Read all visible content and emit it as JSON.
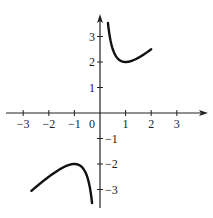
{
  "chart_data": {
    "type": "line",
    "title": "",
    "function": "y = x + 1/x",
    "xlabel": "",
    "ylabel": "",
    "xlim": [
      -3.5,
      4
    ],
    "ylim": [
      -3.7,
      3.8
    ],
    "grid": false,
    "legend": null,
    "x_ticks": [
      -3,
      -2,
      -1,
      1,
      2,
      3
    ],
    "x_tick_labels": [
      "−3",
      "−2",
      "−1",
      "1",
      "2",
      "3"
    ],
    "origin_label": "0",
    "y_ticks": [
      3,
      2,
      1,
      -1,
      -2,
      -3
    ],
    "y_tick_labels": [
      "3",
      "2",
      "1",
      "−1",
      "−2",
      "−3"
    ],
    "series": [
      {
        "name": "right branch",
        "x": [
          0.3,
          0.4,
          0.5,
          0.6,
          0.8,
          1.0,
          1.2,
          1.4,
          1.6,
          1.8,
          2.0
        ],
        "y": [
          3.63,
          2.9,
          2.5,
          2.27,
          2.05,
          2.0,
          2.03,
          2.11,
          2.23,
          2.36,
          2.5
        ]
      },
      {
        "name": "left branch",
        "x": [
          -2.7,
          -2.4,
          -2.0,
          -1.6,
          -1.2,
          -1.0,
          -0.8,
          -0.6,
          -0.5,
          -0.4,
          -0.3
        ],
        "y": [
          -3.07,
          -2.82,
          -2.5,
          -2.23,
          -2.03,
          -2.0,
          -2.05,
          -2.27,
          -2.5,
          -2.9,
          -3.63
        ]
      }
    ]
  }
}
